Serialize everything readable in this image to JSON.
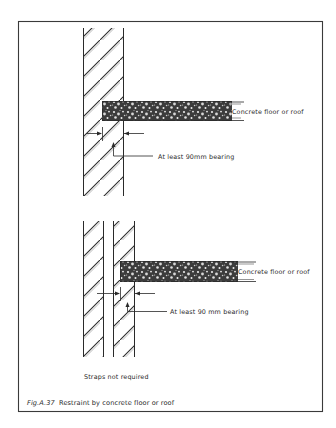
{
  "figure": {
    "number": "Fig.A.37",
    "caption": "Restraint by concrete floor or roof"
  },
  "diagram_top": {
    "slab_label": "Concrete floor or roof",
    "bearing_label": "At least 90mm bearing",
    "wall_type": "solid wall"
  },
  "diagram_bottom": {
    "slab_label": "Concrete floor or roof",
    "bearing_label": "At least 90 mm bearing",
    "wall_type": "cavity wall",
    "note": "Straps not required"
  },
  "colors": {
    "line": "#2a2a2a",
    "frame": "#3a3a3a",
    "background": "#ffffff",
    "concrete_dark": "#3c3c3c",
    "concrete_pebble": "#e8e8e8"
  }
}
